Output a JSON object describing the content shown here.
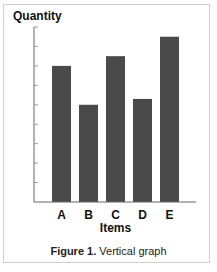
{
  "chart_data": {
    "type": "bar",
    "title": "",
    "ylabel": "Quantity",
    "xlabel": "Items",
    "categories": [
      "A",
      "B",
      "C",
      "D",
      "E"
    ],
    "values": [
      7.0,
      5.0,
      7.5,
      5.3,
      8.5
    ],
    "ylim": [
      0,
      9
    ],
    "y_ticks": [
      1,
      2,
      3,
      4,
      5,
      6,
      7,
      8,
      9
    ],
    "y_tick_labels_shown": false,
    "grid": false,
    "legend": null,
    "bar_color": "#4a4a4a",
    "caption_bold": "Figure 1.",
    "caption_text": "Vertical graph"
  },
  "figure": {
    "caption_bold": "Figure 1.",
    "caption_text": " Vertical graph"
  }
}
